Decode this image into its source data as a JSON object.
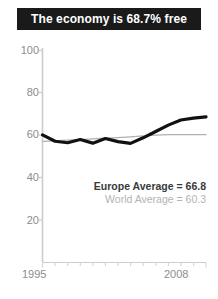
{
  "title": {
    "text": "The economy is 68.7% free"
  },
  "annotations": {
    "europe": "Europe Average = 66.8",
    "world": "World Average = 60.3"
  },
  "colors": {
    "banner_background": "#1a1a1a",
    "banner_text": "#ffffff",
    "europe_line": "#111111",
    "world_line": "#b0b0b0",
    "axis": "#cccccc",
    "tick_label": "#8c8c8c",
    "annotation_europe": "#3a3a3a",
    "annotation_world": "#b3b3b3",
    "plot_background": "#ffffff"
  },
  "chart_data": {
    "type": "line",
    "title": "The economy is 68.7% free",
    "xlabel": "",
    "ylabel": "",
    "xlim": [
      1995,
      2008
    ],
    "ylim": [
      0,
      100
    ],
    "yticks": [
      20,
      40,
      60,
      80,
      100
    ],
    "ytick_labels": [
      "20",
      "40",
      "60",
      "80",
      "100"
    ],
    "xticks": [
      1995,
      1996,
      1997,
      1998,
      1999,
      2000,
      2001,
      2002,
      2003,
      2004,
      2005,
      2006,
      2007,
      2008
    ],
    "xtick_labels_shown": [
      "1995",
      "2008"
    ],
    "grid": false,
    "legend_position": "none",
    "x": [
      1995,
      1996,
      1997,
      1998,
      1999,
      2000,
      2001,
      2002,
      2003,
      2004,
      2005,
      2006,
      2007,
      2008
    ],
    "series": [
      {
        "name": "Europe",
        "style": "thick-black",
        "average": 66.8,
        "final_value": 68.7,
        "values": [
          60.2,
          57.2,
          56.5,
          58.0,
          56.3,
          58.5,
          57.0,
          56.2,
          58.8,
          61.8,
          64.8,
          67.2,
          68.1,
          68.7
        ]
      },
      {
        "name": "World",
        "style": "thin-gray",
        "average": 60.3,
        "final_value": 60.3,
        "values": [
          57.1,
          57.4,
          57.7,
          58.0,
          58.3,
          58.6,
          58.9,
          59.3,
          59.7,
          60.1,
          60.3,
          60.3,
          60.3,
          60.3
        ]
      }
    ]
  }
}
